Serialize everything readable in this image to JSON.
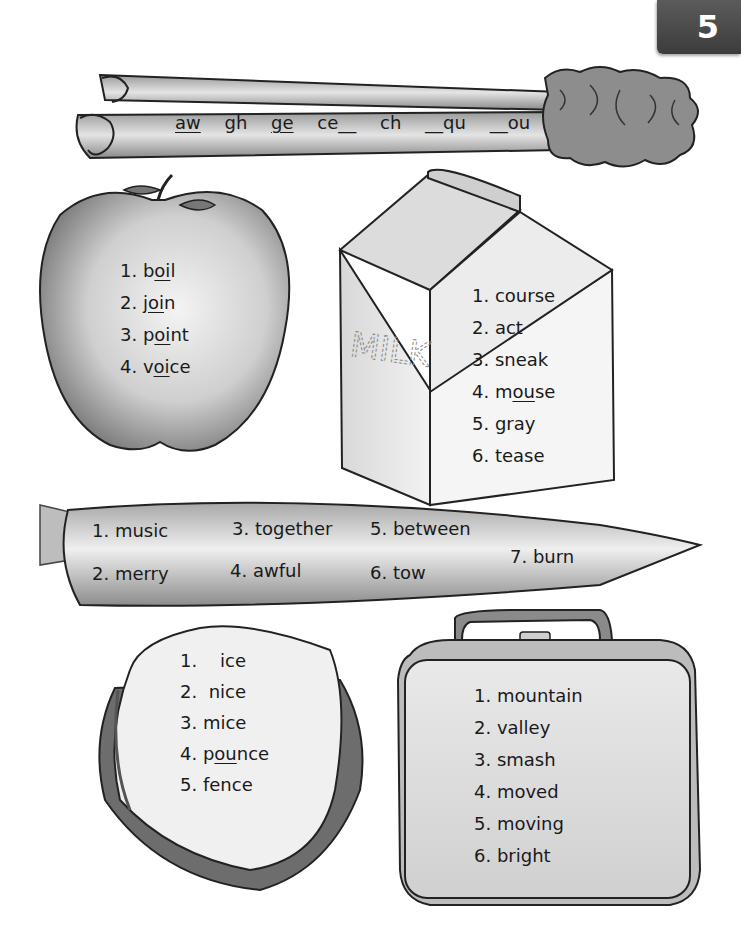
{
  "page": {
    "number": "5",
    "tab_color": "#4a4a4a"
  },
  "celery": {
    "letter_patterns": [
      "_aw",
      "gh",
      "ge",
      "ce__",
      "ch",
      "__qu",
      "__ou"
    ],
    "display": [
      "aw",
      "gh",
      "ge",
      "ce__",
      "ch",
      "__qu",
      "__ou"
    ]
  },
  "apple": {
    "items": [
      {
        "num": "1.",
        "pre": "b",
        "mark": "oi",
        "post": "l"
      },
      {
        "num": "2.",
        "pre": "j",
        "mark": "oi",
        "post": "n"
      },
      {
        "num": "3.",
        "pre": "p",
        "mark": "oi",
        "post": "nt"
      },
      {
        "num": "4.",
        "pre": "v",
        "mark": "oi",
        "post": "ce"
      }
    ]
  },
  "milk": {
    "label": "MILK",
    "items": [
      {
        "num": "1.",
        "pre": "course",
        "mark": "",
        "post": ""
      },
      {
        "num": "2.",
        "pre": "act",
        "mark": "",
        "post": ""
      },
      {
        "num": "3.",
        "pre": "sneak",
        "mark": "",
        "post": ""
      },
      {
        "num": "4.",
        "pre": "m",
        "mark": "ou",
        "post": "se"
      },
      {
        "num": "5.",
        "pre": "gray",
        "mark": "",
        "post": ""
      },
      {
        "num": "6.",
        "pre": "tease",
        "mark": "",
        "post": ""
      }
    ]
  },
  "carrot": {
    "items": [
      {
        "num": "1.",
        "word": "music"
      },
      {
        "num": "2.",
        "word": "merry"
      },
      {
        "num": "3.",
        "word": "together"
      },
      {
        "num": "4.",
        "word": "awful"
      },
      {
        "num": "5.",
        "word": "between"
      },
      {
        "num": "6.",
        "word": "tow"
      },
      {
        "num": "7.",
        "word": "burn"
      }
    ]
  },
  "sandwich": {
    "items": [
      {
        "num": "1.",
        "pre": "ice",
        "mark": "",
        "post": ""
      },
      {
        "num": "2.",
        "pre": "nice",
        "mark": "",
        "post": ""
      },
      {
        "num": "3.",
        "pre": "mice",
        "mark": "",
        "post": ""
      },
      {
        "num": "4.",
        "pre": "p",
        "mark": "ou",
        "post": "nce"
      },
      {
        "num": "5.",
        "pre": "fence",
        "mark": "",
        "post": ""
      }
    ]
  },
  "lunchbox": {
    "items": [
      {
        "num": "1.",
        "word": "mountain"
      },
      {
        "num": "2.",
        "word": "valley"
      },
      {
        "num": "3.",
        "word": "smash"
      },
      {
        "num": "4.",
        "word": "moved"
      },
      {
        "num": "5.",
        "word": "moving"
      },
      {
        "num": "6.",
        "word": "bright"
      }
    ]
  }
}
